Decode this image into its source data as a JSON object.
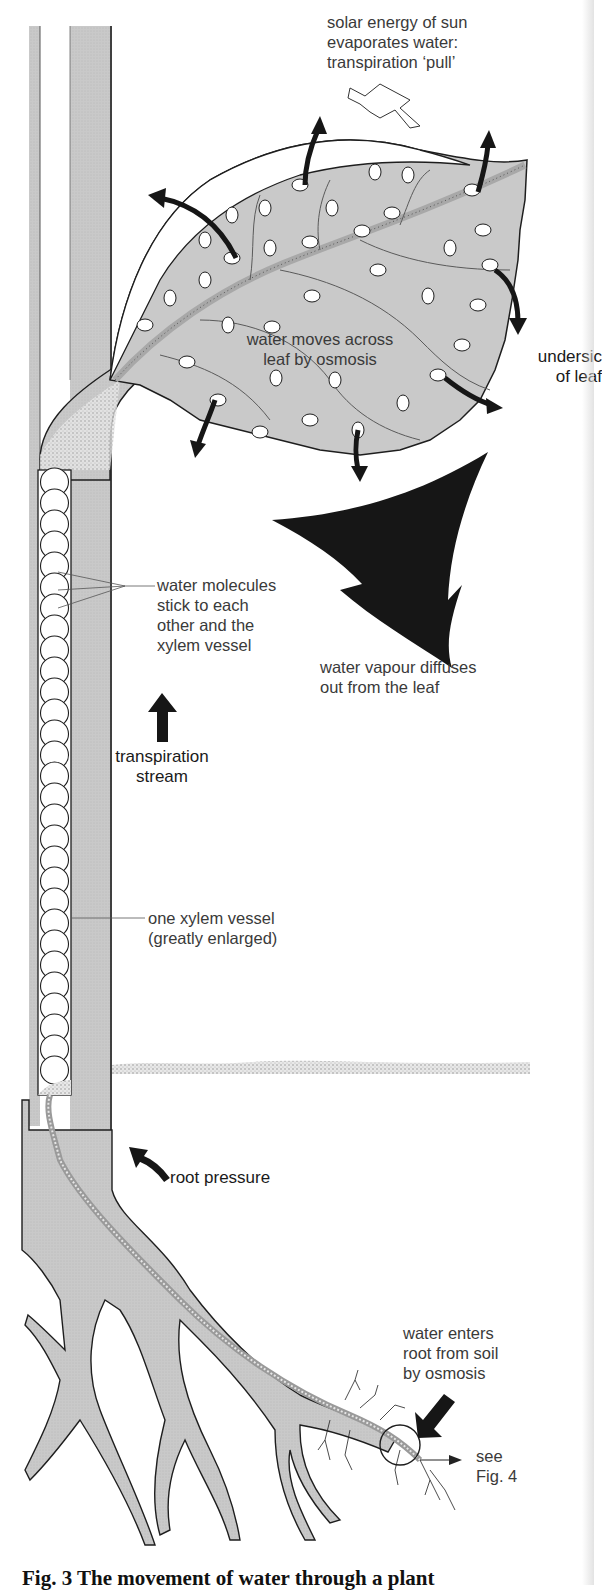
{
  "figure": {
    "caption": "Fig. 3  The movement of water through a plant",
    "colors": {
      "tissue_gray": "#c9c9c9",
      "outline": "#1e1e1e",
      "arrow_black": "#161616",
      "text": "#3a3a3a",
      "background": "#ffffff"
    }
  },
  "labels": {
    "solar_energy": "solar energy of sun\nevaporates water:\ntranspiration ‘pull’",
    "water_moves": "water moves across\nleaf by osmosis",
    "underside": "undersic\nof leaf",
    "molecules_stick": "water molecules\nstick to each\nother and the\nxylem vessel",
    "vapour_diffuses": "water vapour diffuses\nout from the leaf",
    "transpiration_stream": "transpiration\nstream",
    "one_xylem_vessel": "one xylem vessel\n(greatly enlarged)",
    "root_pressure": "root pressure",
    "water_enters_root": "water enters\nroot from soil\nby osmosis",
    "see_fig": "see\nFig. 4"
  },
  "icons": {
    "sun_arrow": "hollow-arrow-down-right",
    "evaporation_arrows": "curved-black-arrow",
    "vapour_arrow": "large-black-arrowhead-down",
    "transpiration_arrow": "black-arrow-up",
    "root_pressure_arrow": "black-arrow-up-left",
    "soil_entry_arrow": "black-arrow-down-left",
    "see_fig_arrow": "thin-arrow-right"
  }
}
